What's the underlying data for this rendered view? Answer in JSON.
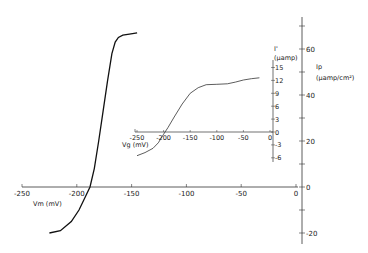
{
  "chart_data": [
    {
      "type": "line",
      "name": "main",
      "title": "",
      "xlabel": "Vm (mV)",
      "ylabel": "Ip (µamp/cm²)",
      "xlim": [
        -250,
        0
      ],
      "ylim": [
        -25,
        75
      ],
      "x_ticks": [
        "-250",
        "-200",
        "-150",
        "-100",
        "-50",
        "0"
      ],
      "y_ticks": [
        "60",
        "40",
        "20",
        "0",
        "-20"
      ],
      "grid": false,
      "series": [
        {
          "name": "Ip",
          "x": [
            -225,
            -215,
            -205,
            -198,
            -192,
            -188,
            -184,
            -180,
            -176,
            -172,
            -168,
            -165,
            -162,
            -158,
            -152,
            -145
          ],
          "y": [
            -20,
            -19,
            -15,
            -10,
            -4,
            0,
            8,
            20,
            33,
            46,
            58,
            63,
            65,
            66,
            66.5,
            67
          ]
        }
      ]
    },
    {
      "type": "line",
      "name": "inset",
      "title": "",
      "xlabel": "Vg (mV)",
      "ylabel": "I' (µamp)",
      "xlim": [
        -250,
        0
      ],
      "ylim": [
        -6,
        15
      ],
      "x_ticks": [
        "-250",
        "-200",
        "-150",
        "-100",
        "-50",
        "0"
      ],
      "y_ticks": [
        "15",
        "12",
        "9",
        "6",
        "3",
        "0",
        "-3",
        "-6"
      ],
      "grid": false,
      "series": [
        {
          "name": "I'",
          "x": [
            -250,
            -235,
            -220,
            -210,
            -200,
            -192,
            -180,
            -165,
            -150,
            -135,
            -120,
            -100,
            -80,
            -65,
            -50,
            -35,
            -20
          ],
          "y": [
            -5.5,
            -4.8,
            -3.8,
            -2.5,
            -0.5,
            1.0,
            3.5,
            6.5,
            9.0,
            10.3,
            11.0,
            11.1,
            11.2,
            11.6,
            12.1,
            12.4,
            12.6
          ]
        }
      ]
    }
  ],
  "labels": {
    "main_x_axis": "Vm (mV)",
    "main_y_axis_1": "Ip",
    "main_y_axis_2": "(µamp/cm²)",
    "inset_x_axis": "Vg (mV)",
    "inset_y_axis_1": "I'",
    "inset_y_axis_2": "(µamp)"
  }
}
